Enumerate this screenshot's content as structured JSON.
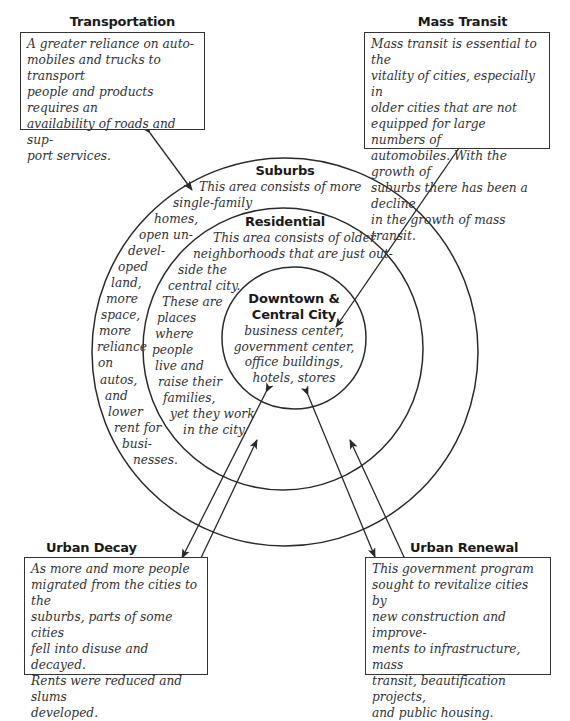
{
  "boxes": {
    "transportation": {
      "title": "Transportation",
      "lines": [
        "A greater reliance on auto-",
        "mobiles and trucks to transport",
        "people and products requires an",
        "availability of roads and sup-",
        "port services."
      ]
    },
    "mass_transit": {
      "title": "Mass Transit",
      "lines": [
        "Mass transit is essential to the",
        "vitality of cities, especially in",
        "older cities that are not",
        "equipped for large numbers of",
        "automobiles. With the growth of",
        "suburbs there has been a decline",
        "in the growth of mass transit."
      ]
    },
    "urban_decay": {
      "title": "Urban Decay",
      "lines": [
        "As more and more people",
        "migrated from the cities to the",
        "suburbs, parts of some cities",
        "fell into disuse and decayed.",
        "Rents were reduced and slums",
        "developed."
      ]
    },
    "urban_renewal": {
      "title": "Urban Renewal",
      "lines": [
        "This government program",
        "sought to revitalize cities by",
        "new construction and improve-",
        "ments to infrastructure, mass",
        "transit, beautification projects,",
        "and public housing."
      ]
    }
  },
  "rings": {
    "suburbs": {
      "title": "Suburbs",
      "lines": [
        "This area consists of more",
        "single-family",
        "homes,",
        "open un-",
        "devel-",
        "oped",
        "land,",
        "more",
        "space,",
        "more",
        "reliance",
        "on",
        "autos,",
        "and",
        "lower",
        "rent for",
        "busi-",
        "nesses."
      ]
    },
    "residential": {
      "title": "Residential",
      "lines": [
        "This area consists of older",
        "neighborhoods that are just out-",
        "side the",
        "central city.",
        "These are",
        "places",
        "where",
        "people",
        "live and",
        "raise their",
        "families,",
        "yet they work",
        "in the city."
      ]
    },
    "downtown": {
      "title_line1": "Downtown &",
      "title_line2": "Central City",
      "lines": [
        "business center,",
        "government center,",
        "office buildings,",
        "hotels, stores"
      ]
    }
  },
  "colors": {
    "line": "#2a2a2a",
    "text": "#333333",
    "background": "#ffffff"
  }
}
